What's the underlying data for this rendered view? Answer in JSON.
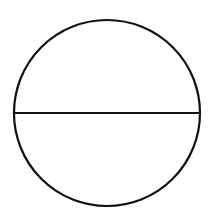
{
  "diagram": {
    "circle": {
      "cx": 107,
      "cy": 113,
      "r": 93
    },
    "diameter": {
      "x1": 14,
      "y1": 113,
      "x2": 200,
      "y2": 113
    },
    "stroke_color": "#111111",
    "stroke_width": 2.2,
    "background": "#ffffff"
  }
}
